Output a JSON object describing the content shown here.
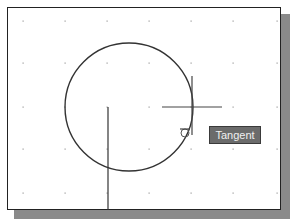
{
  "tooltip": {
    "label": "Tangent"
  },
  "grid": {
    "x": [
      23,
      65,
      107,
      149,
      191,
      233,
      277
    ],
    "y": [
      21,
      63,
      107,
      149,
      193
    ]
  },
  "drawing": {
    "circle": {
      "cx": 129,
      "cy": 107,
      "r": 64
    },
    "line": {
      "x1": 108,
      "y1": 107,
      "x2": 108,
      "y2": 210
    },
    "crosshair": {
      "cx": 192,
      "cy": 107,
      "h_left": 162,
      "h_right": 222,
      "v_top": 76,
      "v_bottom": 135
    },
    "tangent_marker": {
      "cx": 185,
      "cy": 133,
      "r": 4
    }
  },
  "colors": {
    "frame": "#222222",
    "shadow": "#8a8a8a",
    "tooltip_bg": "#6b6b6b",
    "tooltip_text": "#f0f0f0",
    "stroke": "#333333"
  }
}
